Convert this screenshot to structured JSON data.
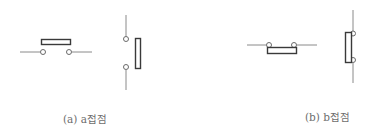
{
  "figure": {
    "panels": [
      {
        "id": "a",
        "caption": "(a) a접점",
        "contact_type": "normally-open",
        "symbols": [
          "horizontal",
          "vertical"
        ]
      },
      {
        "id": "b",
        "caption": "(b) b접점",
        "contact_type": "normally-closed",
        "symbols": [
          "horizontal",
          "vertical"
        ]
      }
    ],
    "colors": {
      "wire": "#8a8a8a",
      "contact": "#3a3a3a",
      "label": "#6e6e6e"
    }
  }
}
